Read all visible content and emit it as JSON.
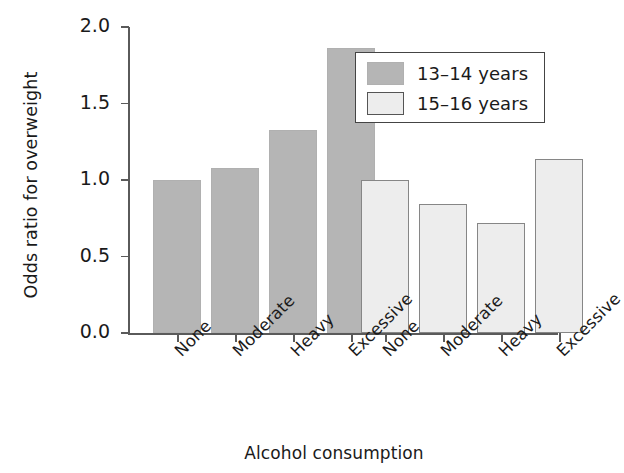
{
  "chart_data": {
    "type": "bar",
    "title": "",
    "xlabel": "Alcohol consumption",
    "ylabel": "Odds ratio for overweight",
    "categories": [
      "None",
      "Moderate",
      "Heavy",
      "Excessive"
    ],
    "series": [
      {
        "name": "13–14 years",
        "color": "#b5b5b5",
        "values": [
          1.0,
          1.08,
          1.33,
          1.86
        ]
      },
      {
        "name": "15–16 years",
        "color": "#ededed",
        "values": [
          1.0,
          0.84,
          0.72,
          1.14
        ]
      }
    ],
    "ylim": [
      0.0,
      2.0
    ],
    "yticks": [
      "0.0",
      "0.5",
      "1.0",
      "1.5",
      "2.0"
    ],
    "ytick_values": [
      0.0,
      0.5,
      1.0,
      1.5,
      2.0
    ],
    "grid": false,
    "legend_position": "top-right",
    "xtick_label_rotation": -45,
    "grouped": true,
    "group_order": [
      "13–14 years",
      "15–16 years"
    ]
  },
  "axis": {
    "y": {
      "title": "Odds ratio for overweight",
      "ticks": [
        "0.0",
        "0.5",
        "1.0",
        "1.5",
        "2.0"
      ]
    },
    "x": {
      "title": "Alcohol consumption",
      "ticks": [
        "None",
        "Moderate",
        "Heavy",
        "Excessive",
        "None",
        "Moderate",
        "Heavy",
        "Excessive"
      ]
    }
  },
  "legend": {
    "entries": [
      {
        "label": "13–14 years"
      },
      {
        "label": "15–16 years"
      }
    ]
  }
}
